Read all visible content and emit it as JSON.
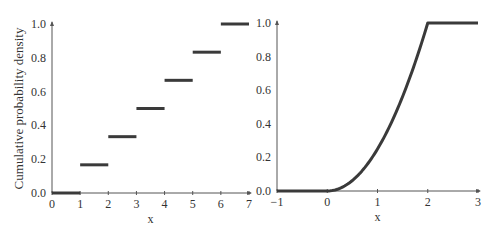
{
  "chart_data": [
    {
      "type": "line",
      "subtype": "step",
      "title": "",
      "xlabel": "x",
      "ylabel": "Cumulative probability density",
      "xlim": [
        0,
        7
      ],
      "ylim": [
        0,
        1.0
      ],
      "xticks": [
        "0",
        "1",
        "2",
        "3",
        "4",
        "5",
        "6",
        "7"
      ],
      "yticks": [
        "0.0",
        "0.2",
        "0.4",
        "0.6",
        "0.8",
        "1.0"
      ],
      "grid": false,
      "series": [
        {
          "name": "discrete CDF",
          "segments": [
            {
              "x0": 0,
              "x1": 1,
              "y": 0.0
            },
            {
              "x0": 1,
              "x1": 2,
              "y": 0.1667
            },
            {
              "x0": 2,
              "x1": 3,
              "y": 0.3333
            },
            {
              "x0": 3,
              "x1": 4,
              "y": 0.5
            },
            {
              "x0": 4,
              "x1": 5,
              "y": 0.6667
            },
            {
              "x0": 5,
              "x1": 6,
              "y": 0.8333
            },
            {
              "x0": 6,
              "x1": 7,
              "y": 1.0
            }
          ]
        }
      ]
    },
    {
      "type": "line",
      "title": "",
      "xlabel": "x",
      "ylabel": "",
      "xlim": [
        -1,
        3
      ],
      "ylim": [
        0,
        1.0
      ],
      "xticks": [
        "−1",
        "0",
        "1",
        "2",
        "3"
      ],
      "yticks": [
        "0.0",
        "0.2",
        "0.4",
        "0.6",
        "0.8",
        "1.0"
      ],
      "grid": false,
      "series": [
        {
          "name": "continuous CDF",
          "x": [
            -1,
            0,
            0.25,
            0.5,
            0.75,
            1.0,
            1.25,
            1.5,
            1.75,
            2.0,
            3.0
          ],
          "y": [
            0,
            0,
            0.0156,
            0.0625,
            0.1406,
            0.25,
            0.3906,
            0.5625,
            0.7656,
            1.0,
            1.0
          ]
        }
      ]
    }
  ],
  "style": {
    "line_color": "#3a3a3a",
    "axis_color": "#555555"
  }
}
